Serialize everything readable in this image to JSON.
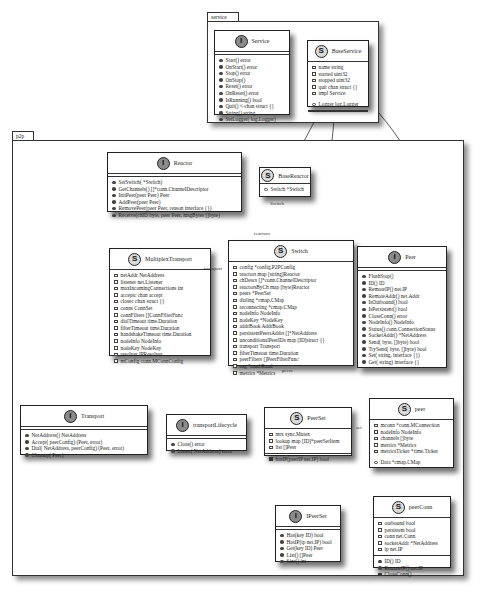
{
  "packages": [
    {
      "name": "service"
    },
    {
      "name": "p2p"
    }
  ],
  "classes": {
    "service": {
      "kind": "I",
      "name": "Service",
      "methods": [
        "Start() error",
        "OnStart() error",
        "Stop() error",
        "OnStop()",
        "Reset() error",
        "OnReset() error",
        "IsRunning() bool",
        "Quit() <-chan struct {}",
        "String() string",
        "SetLogger( log.Logger)"
      ]
    },
    "baseService": {
      "kind": "S",
      "name": "BaseService",
      "fields": [
        "name string",
        "started uint32",
        "stopped uint32",
        "quit chan struct {}",
        "impl Service"
      ],
      "public_fields": [
        "Logger log.Logger"
      ]
    },
    "reactor": {
      "kind": "I",
      "name": "Reactor",
      "methods": [
        "SetSwitch( *Switch)",
        "GetChannels() []*conn.ChannelDescriptor",
        "InitPeer(peer Peer) Peer",
        "AddPeer(peer Peer)",
        "RemovePeer(peer Peer, reason    interface {})",
        "Receive(chID byte, peer Peer, msgBytes []byte)"
      ]
    },
    "baseReactor": {
      "kind": "S",
      "name": "BaseReactor",
      "public_fields": [
        "Switch *Switch"
      ]
    },
    "multiplexTransport": {
      "kind": "S",
      "name": "MultiplexTransport",
      "fields": [
        "netAddr NetAddress",
        "listener net.Listener",
        "maxIncomingConnections int",
        "acceptc  chan accept",
        "closec  chan struct {}",
        "conns ConnSet",
        "connFilters []ConnFilterFunc",
        "dialTimeout time.Duration",
        "filterTimeout time.Duration",
        "handshakeTimeout time.Duration",
        "nodeInfo NodeInfo",
        "nodeKey NodeKey",
        "resolver IPResolver",
        "mConfig conn.MConnConfig"
      ]
    },
    "switch": {
      "kind": "S",
      "name": "Switch",
      "fields": [
        "config *config.P2PConfig",
        "reactors  map [string]Reactor",
        "chDescs []*conn.ChannelDescriptor",
        "reactorsByCh  map [byte]Reactor",
        "peers *PeerSet",
        "dialing *cmap.CMap",
        "reconnecting *cmap.CMap",
        "nodeInfo NodeInfo",
        "nodeKey *NodeKey",
        "addrBook AddrBook",
        "persistentPeersAddrs []*NetAddress",
        "unconditionalPeerIDs   map [ID]struct {}",
        "transport Transport",
        "filterTimeout time.Duration",
        "peerFilters []PeerFilterFunc",
        "rng *rand.Rand",
        "metrics *Metrics"
      ]
    },
    "peer": {
      "kind": "I",
      "name": "Peer",
      "methods": [
        "FlushStop()",
        "ID() ID",
        "RemoteIP() net.IP",
        "RemoteAddr() net.Addr",
        "IsOutbound() bool",
        "IsPersistent() bool",
        "CloseConn() error",
        "NodeInfo() NodeInfo",
        "Status() conn.ConnectionStatus",
        "SocketAddr() *NetAddress",
        "Send( byte, []byte) bool",
        "TrySend( byte, []byte) bool",
        "Set( string,    interface {})",
        "Get( string)  interface {}"
      ]
    },
    "transport": {
      "kind": "I",
      "name": "Transport",
      "methods": [
        "NetAddress() NetAddress",
        "Accept( peerConfig) (Peer, error)",
        "Dial( NetAddress, peerConfig) (Peer, error)",
        "Cleanup( Peer)"
      ]
    },
    "transportLifecycle": {
      "kind": "I",
      "name": "transportLifecycle",
      "methods": [
        "Close() error",
        "Listen( NetAddress) error"
      ]
    },
    "peerSet": {
      "kind": "S",
      "name": "PeerSet",
      "fields": [
        "mtx sync.Mutex",
        "lookup   map [ID]*peerSetItem",
        "list []Peer"
      ],
      "private_methods": [
        "hasIP(peerIP net.IP) bool"
      ]
    },
    "peerStruct": {
      "kind": "S",
      "name": "peer",
      "fields": [
        "mconn *conn.MConnection",
        "nodeInfo NodeInfo",
        "channels []byte",
        "metrics *Metrics",
        "metricsTicker *time.Ticker"
      ],
      "public_fields": [
        "Data *cmap.CMap"
      ]
    },
    "iPeerSet": {
      "kind": "I",
      "name": "IPeerSet",
      "methods": [
        "Has(key ID) bool",
        "HasIP(ip net.IP) bool",
        "Get(key ID) Peer",
        "List() []Peer",
        "Size() int"
      ]
    },
    "peerConn": {
      "kind": "S",
      "name": "peerConn",
      "fields": [
        "outbound bool",
        "persistent bool",
        "conn net.Conn",
        "socketAddr *NetAddress",
        "ip net.IP"
      ],
      "methods": [
        "ID() ID",
        "RemoteIP() net.IP"
      ],
      "private_methods": [
        "CloseConn()"
      ]
    }
  },
  "edge_labels": {
    "switch_label": "Switch",
    "reactors_label": "reactors",
    "transport_label": "transport",
    "peers_label": "peers",
    "set_label": "set"
  }
}
